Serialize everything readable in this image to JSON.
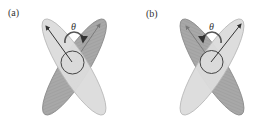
{
  "figure": {
    "panels": [
      {
        "id": "a",
        "label": "(a)",
        "angle_label": "θ",
        "front_ellipse": "light, tilted upper-left to lower-right",
        "back_ellipse": "dark, tilted upper-right to lower-left",
        "main_arrow_direction": "upper-left"
      },
      {
        "id": "b",
        "label": "(b)",
        "angle_label": "θ",
        "front_ellipse": "light, tilted upper-right to lower-left",
        "back_ellipse": "dark, tilted upper-left to lower-right",
        "main_arrow_direction": "upper-right"
      }
    ],
    "colors": {
      "light_fill": "#dcdcdc",
      "light_stroke": "#b8b8b8",
      "dark_fill": "#a8a8a8",
      "dark_stroke": "#8a8a8a",
      "circle_stroke": "#444444",
      "arrow": "#333333"
    }
  }
}
